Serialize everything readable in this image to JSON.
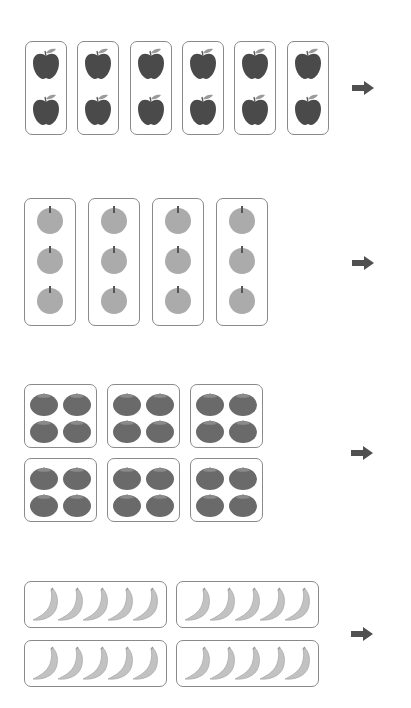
{
  "worksheet": {
    "groups": [
      {
        "id": "red-apples",
        "fruit": "red apple",
        "box_count": 6,
        "items_per_box": 2,
        "layout": "1 column x 2 rows",
        "color": "#4a4a4a",
        "arrow": "right-arrow"
      },
      {
        "id": "green-apples",
        "fruit": "round apple",
        "box_count": 4,
        "items_per_box": 3,
        "layout": "1 column x 3 rows",
        "color": "#a9a9a9",
        "arrow": "right-arrow"
      },
      {
        "id": "tomatoes",
        "fruit": "tomato",
        "box_count": 6,
        "items_per_box": 4,
        "layout": "2 columns x 2 rows",
        "color": "#6e6e6e",
        "arrow": "right-arrow"
      },
      {
        "id": "bananas",
        "fruit": "banana",
        "box_count": 4,
        "items_per_box": 5,
        "layout": "5 in a row",
        "color": "#c2c2c2",
        "arrow": "right-arrow"
      }
    ],
    "colors": {
      "box_border": "#8a8a8a",
      "arrow": "#505050",
      "background": "#ffffff"
    }
  }
}
